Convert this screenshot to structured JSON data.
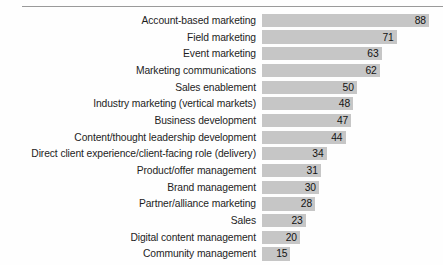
{
  "chart_data": {
    "type": "bar",
    "orientation": "horizontal",
    "title": "",
    "subtitle": "",
    "xlabel": "",
    "ylabel": "",
    "grid": false,
    "legend": null,
    "xlim": [
      0,
      88
    ],
    "value_labels_shown": true,
    "categories": [
      "Account-based marketing",
      "Field marketing",
      "Event marketing",
      "Marketing communications",
      "Sales enablement",
      "Industry marketing (vertical markets)",
      "Business development",
      "Content/thought leadership development",
      "Direct client experience/client-facing role (delivery)",
      "Product/offer management",
      "Brand management",
      "Partner/alliance marketing",
      "Sales",
      "Digital content management",
      "Community management"
    ],
    "values": [
      88,
      71,
      63,
      62,
      50,
      48,
      47,
      44,
      34,
      31,
      30,
      28,
      23,
      20,
      15
    ],
    "colors": {
      "bar_fill": "#c6c6c6",
      "label_text": "#1d1d1d",
      "value_text": "#121212",
      "rule": "#9a9a9a",
      "background": "#fefefe"
    }
  }
}
